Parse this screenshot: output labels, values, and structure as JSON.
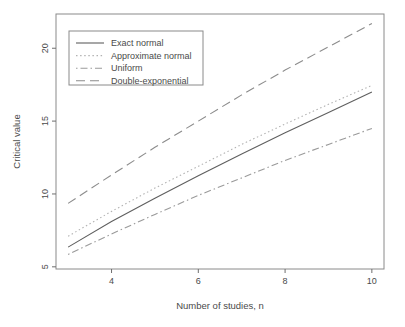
{
  "figure": {
    "background": "#ffffff",
    "box_color": "#8a8a8a",
    "tick_color": "#6e6e6e",
    "text_color": "#4a4a4a"
  },
  "chart_data": {
    "type": "line",
    "title": "",
    "xlabel": "Number of studies, n",
    "ylabel": "Critical value",
    "xlim": [
      2.72,
      10.28
    ],
    "ylim": [
      4.85,
      22.35
    ],
    "xticks": [
      4,
      6,
      8,
      10
    ],
    "yticks": [
      5,
      10,
      15,
      20
    ],
    "grid": false,
    "legend_position": "top-left",
    "x": [
      3,
      4,
      5,
      6,
      7,
      8,
      9,
      10
    ],
    "series": [
      {
        "name": "Exact normal",
        "linestyle": "solid",
        "color": "#5f5f5f",
        "values": [
          6.35,
          8.1,
          9.7,
          11.25,
          12.75,
          14.2,
          15.6,
          17.0
        ]
      },
      {
        "name": "Approximate normal",
        "linestyle": "dotted",
        "color": "#b2b2b2",
        "values": [
          7.1,
          8.8,
          10.4,
          11.9,
          13.4,
          14.8,
          16.15,
          17.45
        ]
      },
      {
        "name": "Uniform",
        "linestyle": "dotdash",
        "color": "#9a9a9a",
        "values": [
          5.85,
          7.25,
          8.6,
          9.9,
          11.1,
          12.3,
          13.4,
          14.5
        ]
      },
      {
        "name": "Double-exponential",
        "linestyle": "longdash",
        "color": "#8c8c8c",
        "values": [
          9.35,
          11.3,
          13.2,
          15.0,
          16.8,
          18.5,
          20.1,
          21.7
        ]
      }
    ]
  }
}
